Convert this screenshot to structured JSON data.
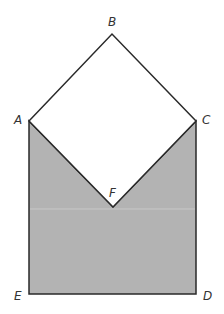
{
  "diagram": {
    "colors": {
      "fill": "#b3b3b3",
      "stroke": "#2a2a2a",
      "background": "#ffffff",
      "seam": "#c8c8c8"
    },
    "points": {
      "A": {
        "label": "A",
        "x": 29,
        "y": 121
      },
      "B": {
        "label": "B",
        "x": 112,
        "y": 34
      },
      "C": {
        "label": "C",
        "x": 196,
        "y": 121
      },
      "D": {
        "label": "D",
        "x": 196,
        "y": 294
      },
      "E": {
        "label": "E",
        "x": 29,
        "y": 294
      },
      "F": {
        "label": "F",
        "x": 113,
        "y": 207
      }
    },
    "shapes": [
      {
        "name": "square-ABCF",
        "vertices": [
          "A",
          "B",
          "C",
          "F"
        ],
        "filled": false
      },
      {
        "name": "shaded-region-AFCDE",
        "vertices": [
          "A",
          "F",
          "C",
          "D",
          "E"
        ],
        "filled": true
      }
    ]
  }
}
